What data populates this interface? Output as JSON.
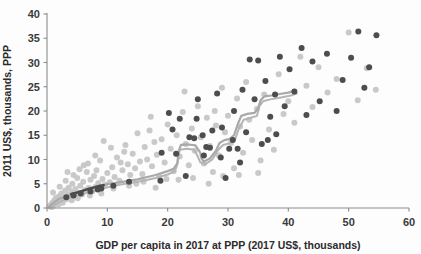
{
  "chart_data": {
    "type": "scatter",
    "title": "",
    "xlabel": "GDP per capita in 2017 at PPP (2017 US$, thousands)",
    "ylabel": "2011 US$, thousands, PPP",
    "xlim": [
      0,
      60
    ],
    "ylim": [
      0,
      40
    ],
    "xticks": [
      0,
      10,
      20,
      30,
      40,
      50,
      60
    ],
    "yticks": [
      0,
      5,
      10,
      15,
      20,
      25,
      30,
      35,
      40
    ],
    "xtick_labels": [
      "0",
      "10",
      "20",
      "30",
      "40",
      "50",
      "60"
    ],
    "ytick_labels": [
      "0",
      "5",
      "10",
      "15",
      "20",
      "25",
      "30",
      "35",
      "40"
    ],
    "grid": false,
    "legend": "none",
    "colors": {
      "background_points": "#c6c6c6",
      "highlight_points": "#4d4d4d",
      "trend_line": "#a9a9a9",
      "axis": "#8c8c8c",
      "text": "#2b2b2b"
    },
    "series": [
      {
        "name": "background-countries",
        "color": "#c6c6c6",
        "marker": "circle",
        "points": [
          [
            0.4,
            0.3
          ],
          [
            0.6,
            0.6
          ],
          [
            0.8,
            0.2
          ],
          [
            0.9,
            1.1
          ],
          [
            1.1,
            0.5
          ],
          [
            1.2,
            1.6
          ],
          [
            1.4,
            0.9
          ],
          [
            1.5,
            2.1
          ],
          [
            1.7,
            1.3
          ],
          [
            1.9,
            0.7
          ],
          [
            2.0,
            2.4
          ],
          [
            2.2,
            1.5
          ],
          [
            2.4,
            3.0
          ],
          [
            2.6,
            1.1
          ],
          [
            2.8,
            2.2
          ],
          [
            3.0,
            3.6
          ],
          [
            3.2,
            1.8
          ],
          [
            3.4,
            2.7
          ],
          [
            3.6,
            4.2
          ],
          [
            3.8,
            2.0
          ],
          [
            4.0,
            3.3
          ],
          [
            4.2,
            5.0
          ],
          [
            4.5,
            2.5
          ],
          [
            4.7,
            3.9
          ],
          [
            5.0,
            6.2
          ],
          [
            5.2,
            3.1
          ],
          [
            5.5,
            4.6
          ],
          [
            5.8,
            2.8
          ],
          [
            6.0,
            5.4
          ],
          [
            6.3,
            3.7
          ],
          [
            6.6,
            7.4
          ],
          [
            6.9,
            4.1
          ],
          [
            7.2,
            5.8
          ],
          [
            7.5,
            3.4
          ],
          [
            7.8,
            6.6
          ],
          [
            8.1,
            4.4
          ],
          [
            8.5,
            5.1
          ],
          [
            8.8,
            9.8
          ],
          [
            9.2,
            6.0
          ],
          [
            9.6,
            4.8
          ],
          [
            10.0,
            7.2
          ],
          [
            10.4,
            5.3
          ],
          [
            10.8,
            8.4
          ],
          [
            11.2,
            6.4
          ],
          [
            11.6,
            10.4
          ],
          [
            12.0,
            5.6
          ],
          [
            12.5,
            7.8
          ],
          [
            13.0,
            13.0
          ],
          [
            13.4,
            9.0
          ],
          [
            13.8,
            6.8
          ],
          [
            14.2,
            11.2
          ],
          [
            14.6,
            8.2
          ],
          [
            15.0,
            15.4
          ],
          [
            15.4,
            9.6
          ],
          [
            15.8,
            7.0
          ],
          [
            16.2,
            12.6
          ],
          [
            16.6,
            10.0
          ],
          [
            17.0,
            16.0
          ],
          [
            17.4,
            8.6
          ],
          [
            17.8,
            13.6
          ],
          [
            18.2,
            11.0
          ],
          [
            18.6,
            6.4
          ],
          [
            19.0,
            14.2
          ],
          [
            19.5,
            9.4
          ],
          [
            20.0,
            17.2
          ],
          [
            20.5,
            12.2
          ],
          [
            21.0,
            7.6
          ],
          [
            21.5,
            15.0
          ],
          [
            22.0,
            10.6
          ],
          [
            22.5,
            19.8
          ],
          [
            23.0,
            13.2
          ],
          [
            23.5,
            8.8
          ],
          [
            24.0,
            16.4
          ],
          [
            24.5,
            11.8
          ],
          [
            25.0,
            21.0
          ],
          [
            25.5,
            14.6
          ],
          [
            26.0,
            9.2
          ],
          [
            26.5,
            18.6
          ],
          [
            27.0,
            12.8
          ],
          [
            27.5,
            7.4
          ],
          [
            28.0,
            17.0
          ],
          [
            28.5,
            10.8
          ],
          [
            29.0,
            24.8
          ],
          [
            29.5,
            15.6
          ],
          [
            30.0,
            19.0
          ],
          [
            30.5,
            13.4
          ],
          [
            31.0,
            8.2
          ],
          [
            31.5,
            22.6
          ],
          [
            32.0,
            16.8
          ],
          [
            32.5,
            11.4
          ],
          [
            33.0,
            26.0
          ],
          [
            33.5,
            18.2
          ],
          [
            34.0,
            14.0
          ],
          [
            34.8,
            20.4
          ],
          [
            35.4,
            9.8
          ],
          [
            36.0,
            23.4
          ],
          [
            36.8,
            16.2
          ],
          [
            37.6,
            12.0
          ],
          [
            38.4,
            27.6
          ],
          [
            39.2,
            19.4
          ],
          [
            40.0,
            22.0
          ],
          [
            41.0,
            17.6
          ],
          [
            42.0,
            31.2
          ],
          [
            43.0,
            25.2
          ],
          [
            44.0,
            20.8
          ],
          [
            45.0,
            29.0
          ],
          [
            46.5,
            23.8
          ],
          [
            48.0,
            26.6
          ],
          [
            50.0,
            36.2
          ],
          [
            51.5,
            22.2
          ],
          [
            53.0,
            28.8
          ],
          [
            54.5,
            24.4
          ],
          [
            1.0,
            3.2
          ],
          [
            2.1,
            4.4
          ],
          [
            3.1,
            5.6
          ],
          [
            4.1,
            1.6
          ],
          [
            5.1,
            2.0
          ],
          [
            6.1,
            8.8
          ],
          [
            7.1,
            2.6
          ],
          [
            8.0,
            10.8
          ],
          [
            9.0,
            3.0
          ],
          [
            11.0,
            4.0
          ],
          [
            12.2,
            9.4
          ],
          [
            13.6,
            4.6
          ],
          [
            14.8,
            5.0
          ],
          [
            16.0,
            5.4
          ],
          [
            18.0,
            4.2
          ],
          [
            19.8,
            6.0
          ],
          [
            21.8,
            5.8
          ],
          [
            24.2,
            6.2
          ],
          [
            26.8,
            5.0
          ],
          [
            29.2,
            6.6
          ],
          [
            31.8,
            6.8
          ],
          [
            35.0,
            7.2
          ],
          [
            22.8,
            24.0
          ],
          [
            27.8,
            20.0
          ],
          [
            17.2,
            18.8
          ],
          [
            12.8,
            11.6
          ],
          [
            10.6,
            12.4
          ],
          [
            9.4,
            13.8
          ],
          [
            8.2,
            7.8
          ],
          [
            6.8,
            9.2
          ],
          [
            5.4,
            8.0
          ],
          [
            4.4,
            6.8
          ],
          [
            3.4,
            7.4
          ]
        ]
      },
      {
        "name": "highlighted-countries",
        "color": "#4d4d4d",
        "marker": "circle",
        "points": [
          [
            19.0,
            11.4
          ],
          [
            20.2,
            19.6
          ],
          [
            21.4,
            11.2
          ],
          [
            23.0,
            6.6
          ],
          [
            23.6,
            14.6
          ],
          [
            24.4,
            14.4
          ],
          [
            25.0,
            22.4
          ],
          [
            25.8,
            15.0
          ],
          [
            26.4,
            12.6
          ],
          [
            27.0,
            12.4
          ],
          [
            28.2,
            23.6
          ],
          [
            29.0,
            16.6
          ],
          [
            29.6,
            6.2
          ],
          [
            30.2,
            12.2
          ],
          [
            31.0,
            20.0
          ],
          [
            31.6,
            12.2
          ],
          [
            32.4,
            24.4
          ],
          [
            33.0,
            15.6
          ],
          [
            33.6,
            30.6
          ],
          [
            34.4,
            22.4
          ],
          [
            35.0,
            30.4
          ],
          [
            36.2,
            26.2
          ],
          [
            37.0,
            18.8
          ],
          [
            37.8,
            23.4
          ],
          [
            38.6,
            31.2
          ],
          [
            39.4,
            21.0
          ],
          [
            40.2,
            28.6
          ],
          [
            41.0,
            24.0
          ],
          [
            42.2,
            33.0
          ],
          [
            43.0,
            19.2
          ],
          [
            44.0,
            30.2
          ],
          [
            45.2,
            22.0
          ],
          [
            46.4,
            31.8
          ],
          [
            48.0,
            20.0
          ],
          [
            49.0,
            26.4
          ],
          [
            50.4,
            31.0
          ],
          [
            51.6,
            36.4
          ],
          [
            52.6,
            24.8
          ],
          [
            53.4,
            29.0
          ],
          [
            54.6,
            35.6
          ],
          [
            13.6,
            5.4
          ],
          [
            9.0,
            4.0
          ],
          [
            7.2,
            3.4
          ],
          [
            5.6,
            3.0
          ],
          [
            4.4,
            2.6
          ],
          [
            3.2,
            2.2
          ],
          [
            8.4,
            3.8
          ],
          [
            11.0,
            4.6
          ],
          [
            18.8,
            5.6
          ],
          [
            22.0,
            18.4
          ],
          [
            24.8,
            18.4
          ],
          [
            27.4,
            16.0
          ],
          [
            20.8,
            16.2
          ],
          [
            26.0,
            10.8
          ],
          [
            30.8,
            14.0
          ],
          [
            32.0,
            9.4
          ],
          [
            35.6,
            13.2
          ],
          [
            36.6,
            14.0
          ],
          [
            38.0,
            15.2
          ],
          [
            28.8,
            10.4
          ]
        ]
      }
    ],
    "trend_line": {
      "name": "connected-path",
      "color": "#a9a9a9",
      "points": [
        [
          0.3,
          0.2
        ],
        [
          1.0,
          1.0
        ],
        [
          2.0,
          1.9
        ],
        [
          3.0,
          2.3
        ],
        [
          4.0,
          2.8
        ],
        [
          5.0,
          3.2
        ],
        [
          6.0,
          3.6
        ],
        [
          7.0,
          4.0
        ],
        [
          8.0,
          4.4
        ],
        [
          9.0,
          4.6
        ],
        [
          10.0,
          4.9
        ],
        [
          11.0,
          5.1
        ],
        [
          12.0,
          5.3
        ],
        [
          13.0,
          5.5
        ],
        [
          14.0,
          5.7
        ],
        [
          15.0,
          5.9
        ],
        [
          16.0,
          6.2
        ],
        [
          17.0,
          6.5
        ],
        [
          18.0,
          6.8
        ],
        [
          19.0,
          7.2
        ],
        [
          20.0,
          7.6
        ],
        [
          21.0,
          8.1
        ],
        [
          21.6,
          9.2
        ],
        [
          21.8,
          11.6
        ],
        [
          22.2,
          13.0
        ],
        [
          23.4,
          13.1
        ],
        [
          24.6,
          12.9
        ],
        [
          25.4,
          11.4
        ],
        [
          25.6,
          10.2
        ],
        [
          26.0,
          9.6
        ],
        [
          27.0,
          10.2
        ],
        [
          28.0,
          11.8
        ],
        [
          28.6,
          13.4
        ],
        [
          29.4,
          14.0
        ],
        [
          30.2,
          14.2
        ],
        [
          31.0,
          15.0
        ],
        [
          31.6,
          17.2
        ],
        [
          32.2,
          19.0
        ],
        [
          33.2,
          19.4
        ],
        [
          34.4,
          19.6
        ],
        [
          35.0,
          20.6
        ],
        [
          35.4,
          22.2
        ],
        [
          36.0,
          23.0
        ],
        [
          37.2,
          23.2
        ],
        [
          38.6,
          23.5
        ],
        [
          40.0,
          23.8
        ],
        [
          41.2,
          24.2
        ]
      ]
    },
    "trend_line_secondary": {
      "name": "connected-path-offset",
      "color": "#b5b5b5",
      "points": [
        [
          0.5,
          0.0
        ],
        [
          1.5,
          0.8
        ],
        [
          2.5,
          1.5
        ],
        [
          3.5,
          2.0
        ],
        [
          4.5,
          2.4
        ],
        [
          5.5,
          2.8
        ],
        [
          6.5,
          3.1
        ],
        [
          7.5,
          3.5
        ],
        [
          8.5,
          3.8
        ],
        [
          9.5,
          4.1
        ],
        [
          10.5,
          4.4
        ],
        [
          12.0,
          4.8
        ],
        [
          14.0,
          5.2
        ],
        [
          16.0,
          5.6
        ],
        [
          18.0,
          6.2
        ],
        [
          20.0,
          6.9
        ],
        [
          21.2,
          7.6
        ],
        [
          21.6,
          9.0
        ],
        [
          22.0,
          12.0
        ],
        [
          23.2,
          12.2
        ],
        [
          24.4,
          12.0
        ],
        [
          25.0,
          10.6
        ],
        [
          25.4,
          9.4
        ],
        [
          26.2,
          9.0
        ],
        [
          27.4,
          10.0
        ],
        [
          28.4,
          12.0
        ],
        [
          29.2,
          13.0
        ],
        [
          30.4,
          13.4
        ],
        [
          31.2,
          14.2
        ],
        [
          31.8,
          16.4
        ],
        [
          32.6,
          18.2
        ],
        [
          33.8,
          18.6
        ],
        [
          34.8,
          19.0
        ],
        [
          35.2,
          21.0
        ],
        [
          35.8,
          22.0
        ],
        [
          37.0,
          22.4
        ],
        [
          38.8,
          22.8
        ],
        [
          40.4,
          23.2
        ],
        [
          41.4,
          23.6
        ]
      ]
    },
    "dark_segment": {
      "name": "dark-trend-segment",
      "color": "#4a4a4a",
      "points": [
        [
          4.0,
          2.9
        ],
        [
          5.0,
          3.2
        ],
        [
          6.0,
          3.6
        ],
        [
          7.0,
          4.0
        ],
        [
          8.0,
          4.3
        ],
        [
          8.8,
          4.6
        ],
        [
          9.4,
          4.7
        ]
      ]
    }
  }
}
